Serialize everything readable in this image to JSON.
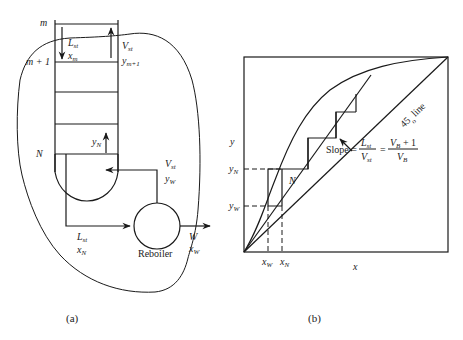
{
  "panel_a": {
    "caption": "(a)",
    "labels": {
      "tray_m": "m",
      "tray_m1": "m + 1",
      "tray_N": "N",
      "L_st": "L",
      "L_st_sub": "st",
      "x_m": "x",
      "x_m_sub": "m",
      "V_st": "V",
      "V_st_sub": "st",
      "y_m1": "y",
      "y_m1_sub": "m+1",
      "y_N": "y",
      "y_N_sub": "N",
      "V_st_bottom": "V",
      "V_st_bottom_sub": "st",
      "y_W": "y",
      "y_W_sub": "W",
      "L_st_bottom": "L",
      "L_st_bottom_sub": "st",
      "x_N": "x",
      "x_N_sub": "N",
      "reboiler": "Reboiler",
      "W": "W",
      "x_W": "x",
      "x_W_sub": "W"
    }
  },
  "panel_b": {
    "caption": "(b)",
    "labels": {
      "y_axis": "y",
      "x_axis": "x",
      "y_N": "y",
      "y_N_sub": "N",
      "y_W": "y",
      "y_W_sub": "W",
      "x_W": "x",
      "x_W_sub": "W",
      "x_N": "x",
      "x_N_sub": "N",
      "stage_N": "N",
      "line_45": "45",
      "line_45_suffix": "line",
      "deg": "o",
      "slope_prefix": "Slope =",
      "slope_num": "L",
      "slope_num_sub": "st",
      "slope_den": "V",
      "slope_den_sub": "st",
      "eq": "=",
      "slope_num2": "V",
      "slope_num2_sub": "B",
      "slope_num2_rest": " + 1",
      "slope_den2": "V",
      "slope_den2_sub": "B"
    }
  }
}
